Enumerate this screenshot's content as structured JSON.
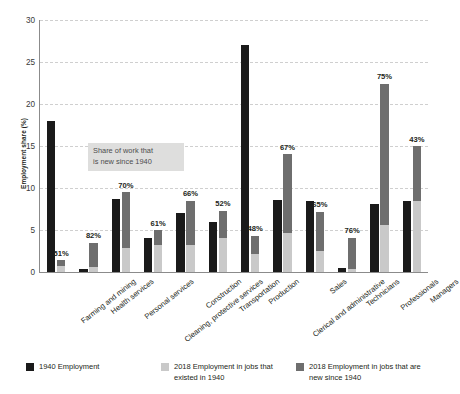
{
  "chart_data": {
    "type": "bar",
    "title": "",
    "subtitle": "",
    "xlabel": "",
    "ylabel": "Employment share (%)",
    "ylim": [
      0,
      30
    ],
    "yticks": [
      0,
      5,
      10,
      15,
      20,
      25,
      30
    ],
    "grid": true,
    "legend_position": "bottom",
    "categories": [
      "Farming and mining",
      "Health services",
      "Personal services",
      "Cleaning, protective services",
      "Construction",
      "Transportation",
      "Production",
      "Clerical and administrative",
      "Sales",
      "Technicians",
      "Professionals",
      "Managers"
    ],
    "series": [
      {
        "name": "1940 Employment",
        "color": "#1a1a1a",
        "values": [
          18.0,
          0.4,
          8.7,
          4.1,
          7.0,
          6.0,
          27.0,
          8.6,
          8.4,
          0.5,
          8.1,
          8.4
        ]
      },
      {
        "name": "2018 Employment in jobs that existed in 1940",
        "color": "#c9c9c9",
        "values": [
          0.7,
          0.6,
          2.9,
          3.2,
          3.2,
          4.0,
          2.2,
          4.7,
          2.5,
          0.4,
          5.6,
          8.4
        ]
      },
      {
        "name": "2018 Employment in jobs that are new since 1940",
        "color": "#6e6e6e",
        "values": [
          0.7,
          2.9,
          6.6,
          1.8,
          5.3,
          3.3,
          2.1,
          9.3,
          4.7,
          3.7,
          16.8,
          6.6
        ]
      }
    ],
    "stacked_totals_2018": [
      1.4,
      3.5,
      9.5,
      5.0,
      8.5,
      7.3,
      4.3,
      14.0,
      7.2,
      4.1,
      22.4,
      15.0
    ],
    "data_labels_pct_new": [
      "51%",
      "82%",
      "70%",
      "61%",
      "66%",
      "52%",
      "48%",
      "67%",
      "65%",
      "76%",
      "75%",
      "43%"
    ],
    "annotation": {
      "text": "Share of work that is new since 1940",
      "line1": "Share of work that",
      "line2": "is new since 1940",
      "background": "#dededd"
    }
  },
  "axis": {
    "y_title": "Employment share (%)",
    "y_ticks": [
      "0",
      "5",
      "10",
      "15",
      "20",
      "25",
      "30"
    ]
  },
  "legend": {
    "items": [
      {
        "label": "1940 Employment",
        "color": "#1a1a1a",
        "swatch_name": "legend-swatch-1940"
      },
      {
        "label": "2018 Employment in jobs that existed in 1940",
        "color": "#c9c9c9",
        "swatch_name": "legend-swatch-2018-existed"
      },
      {
        "label": "2018 Employment in jobs that are new since 1940",
        "color": "#6e6e6e",
        "swatch_name": "legend-swatch-2018-new"
      }
    ]
  },
  "colors": {
    "background": "#ffffff",
    "axis": "#8b8b8b",
    "grid": "#cfcfcf",
    "text": "#231f20",
    "bar_1940": "#1a1a1a",
    "bar_existed": "#c9c9c9",
    "bar_new": "#6e6e6e",
    "annotation_bg": "#dededd"
  }
}
